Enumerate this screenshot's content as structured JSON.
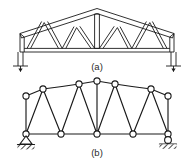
{
  "figure": {
    "ink_color": "#1a1a1a",
    "background_color": "#ffffff",
    "caption_color": "#2b2b2b",
    "panels": [
      {
        "id": "panel-a",
        "caption": "(a)",
        "type": "double-line structural truss drawing",
        "description": "Fink-type roof truss with sloping top chords meeting at a central apex, horizontal bottom chord, vertical king post at apex, and W-pattern diagonal web members, carried on short columns at both ends",
        "support_left": "column-post",
        "support_right": "column-post",
        "member_style": "double-line"
      },
      {
        "id": "panel-b",
        "caption": "(b)",
        "type": "idealized pin-jointed line diagram",
        "description": "Same truss shown as single-line members with circular pin joints; pinned support at the left reaction and roller support at the right reaction",
        "support_left": "pin-support",
        "support_right": "roller-support",
        "member_style": "single-line",
        "joint_marker": "open-circle",
        "joint_count_top": 7,
        "joint_count_bottom": 5
      }
    ]
  }
}
